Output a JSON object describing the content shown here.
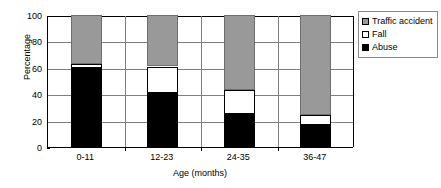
{
  "chart_data": {
    "type": "bar",
    "subtype": "stacked-100-percent",
    "title": "",
    "xlabel": "Age (months)",
    "ylabel": "Percentage",
    "categories": [
      "0-11",
      "12-23",
      "24-35",
      "36-47"
    ],
    "series": [
      {
        "name": "Abuse",
        "color": "#000000",
        "values": [
          60,
          41,
          25,
          17
        ]
      },
      {
        "name": "Fall",
        "color": "#ffffff",
        "values": [
          3,
          20,
          18,
          7
        ]
      },
      {
        "name": "Traffic accident",
        "color": "#999999",
        "values": [
          37,
          39,
          57,
          76
        ]
      }
    ],
    "stack_order_bottom_to_top": [
      "Abuse",
      "Fall",
      "Traffic accident"
    ],
    "cumulative_tops": [
      {
        "category": "0-11",
        "abuse_top": 60,
        "fall_top": 63,
        "traffic_top": 100
      },
      {
        "category": "12-23",
        "abuse_top": 41,
        "fall_top": 61,
        "traffic_top": 100
      },
      {
        "category": "24-35",
        "abuse_top": 25,
        "fall_top": 43,
        "traffic_top": 100
      },
      {
        "category": "36-47",
        "abuse_top": 17,
        "fall_top": 24,
        "traffic_top": 100
      }
    ],
    "ylim": [
      0,
      100
    ],
    "y_ticks": [
      "0",
      "20",
      "40",
      "60",
      "80",
      "100"
    ],
    "y_tick_values": [
      0,
      20,
      40,
      60,
      80,
      100
    ],
    "grid": true,
    "grid_axis": "y",
    "legend_position": "right",
    "legend_entries": [
      "Traffic accident",
      "Fall",
      "Abuse"
    ]
  },
  "axes": {
    "y_title": "Percentage",
    "x_title": "Age (months)"
  },
  "legend": {
    "items": [
      {
        "label": "Traffic accident",
        "swatch": "traffic-swatch-icon"
      },
      {
        "label": "Fall",
        "swatch": "fall-swatch-icon"
      },
      {
        "label": "Abuse",
        "swatch": "abuse-swatch-icon"
      }
    ]
  },
  "colors": {
    "abuse": "#000000",
    "fall": "#ffffff",
    "traffic_accident": "#999999",
    "axis": "#000000",
    "gridline": "#808080",
    "legend_border": "#8a8a8a"
  }
}
